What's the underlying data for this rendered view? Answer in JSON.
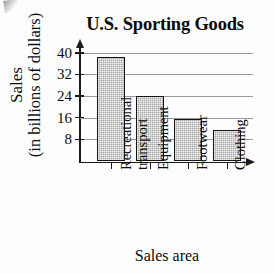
{
  "chart_data": {
    "type": "bar",
    "title": "U.S. Sporting Goods",
    "xlabel": "Sales area",
    "ylabel_line1": "Sales",
    "ylabel_line2": "(in billions of dollars)",
    "categories": [
      "Recreational transport",
      "Equipment",
      "Footwear",
      "Clothing"
    ],
    "category_lines": [
      [
        "Recreational",
        "transport"
      ],
      [
        "Equipment"
      ],
      [
        "Footwear"
      ],
      [
        "Clothing"
      ]
    ],
    "values": [
      38.5,
      24,
      15.5,
      11.5
    ],
    "ylim": [
      0,
      44
    ],
    "yticks": [
      8,
      16,
      24,
      32,
      40
    ],
    "ytick_labels": [
      "8",
      "16",
      "24",
      "32",
      "40"
    ],
    "grid": true,
    "legend": "none",
    "bar_fill": "#a6a6a6",
    "bar_outline": "#151515",
    "gridline_color": "#9a9a9a",
    "axis_color": "#1a1a1a"
  }
}
